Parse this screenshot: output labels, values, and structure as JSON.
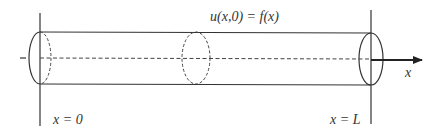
{
  "diagram": {
    "type": "cylindrical rod along x-axis",
    "equation_label": "u(x,0) = f(x)",
    "axis_label": "x",
    "left_boundary_label": "x = 0",
    "right_boundary_label": "x = L"
  },
  "colors": {
    "stroke": "#333333",
    "background": "#ffffff"
  }
}
